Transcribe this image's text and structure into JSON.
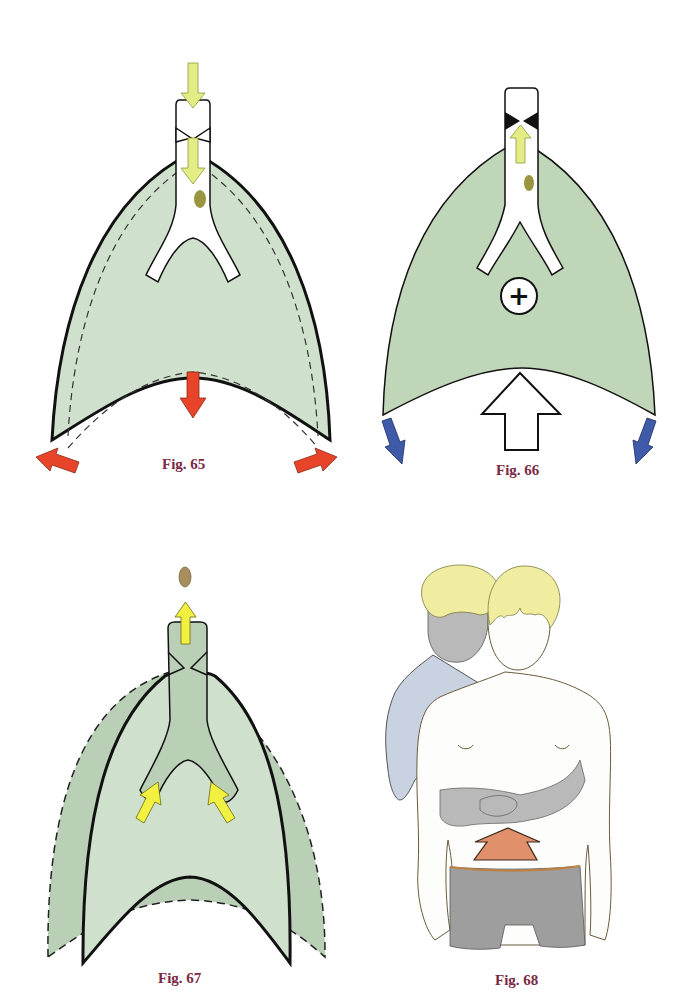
{
  "figures": [
    {
      "id": "fig65",
      "caption": "Fig. 65",
      "description": "Inspiration: lungs expand, diaphragm descends, air enters trachea"
    },
    {
      "id": "fig66",
      "caption": "Fig. 66",
      "description": "Expiration/obstruction: positive pressure, diaphragm pushed upward"
    },
    {
      "id": "fig67",
      "caption": "Fig. 67",
      "description": "Forced compression expels foreign body from airway"
    },
    {
      "id": "fig68",
      "caption": "Fig. 68",
      "description": "Abdominal thrust (Heimlich manoeuvre) performed from behind"
    }
  ],
  "colors": {
    "lung_green": "#cfe0cc",
    "lung_green_dark": "#b9cfb6",
    "lung_green_66": "#bfd6b9",
    "yellow_arrow": "#e4ec86",
    "yellow_arrow_bright": "#f2f040",
    "red_arrow": "#e8442a",
    "blue_arrow": "#3f5aa8",
    "foreign_body": "#9a9640",
    "foreign_body_67": "#a88e5c",
    "caption": "#7a2a45",
    "hair": "#f0eca0",
    "rescuer_skin": "#b9b9b9",
    "rescuer_shirt": "#c9d2e0",
    "shorts": "#9e9e9e",
    "thrust_arrow": "#e0906a"
  },
  "symbols": {
    "positive_pressure": "+"
  }
}
